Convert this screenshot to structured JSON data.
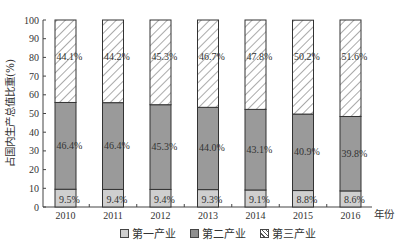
{
  "chart_data": {
    "type": "bar",
    "stacked": true,
    "title": "",
    "xlabel": "年份",
    "ylabel": "占国内生产总值比重(%)",
    "ylim": [
      0,
      100
    ],
    "yticks": [
      0,
      10,
      20,
      30,
      40,
      50,
      60,
      70,
      80,
      90,
      100
    ],
    "categories": [
      "2010",
      "2011",
      "2012",
      "2013",
      "2014",
      "2015",
      "2016"
    ],
    "series": [
      {
        "name": "第一产业",
        "values": [
          9.5,
          9.4,
          9.4,
          9.3,
          9.1,
          8.8,
          8.6
        ],
        "labels": [
          "9.5%",
          "9.4%",
          "9.4%",
          "9.3%",
          "9.1%",
          "8.8%",
          "8.6%"
        ],
        "color": "#cfcfcf",
        "pattern": "solid-light"
      },
      {
        "name": "第二产业",
        "values": [
          46.4,
          46.4,
          45.3,
          44.0,
          43.1,
          40.9,
          39.8
        ],
        "labels": [
          "46.4%",
          "46.4%",
          "45.3%",
          "44.0%",
          "43.1%",
          "40.9%",
          "39.8%"
        ],
        "color": "#9a9a9a",
        "pattern": "solid-dark"
      },
      {
        "name": "第三产业",
        "values": [
          44.1,
          44.2,
          45.3,
          46.7,
          47.8,
          50.2,
          51.6
        ],
        "labels": [
          "44.1%",
          "44.2%",
          "45.3%",
          "46.7%",
          "47.8%",
          "50.2%",
          "51.6%"
        ],
        "color": "#ffffff",
        "pattern": "diagonal-hatch"
      }
    ],
    "legend_position": "bottom",
    "grid": false
  },
  "legend": {
    "items": [
      {
        "label": "第一产业",
        "icon": "light-gray-square"
      },
      {
        "label": "第二产业",
        "icon": "dark-gray-square"
      },
      {
        "label": "第三产业",
        "icon": "hatched-square"
      }
    ]
  }
}
